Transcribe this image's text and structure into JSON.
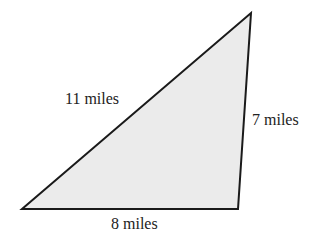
{
  "diagram": {
    "type": "triangle",
    "fill": "#ebebeb",
    "stroke": "#1a1a1a",
    "vertices": [
      [
        22,
        209
      ],
      [
        251,
        13
      ],
      [
        238,
        209
      ]
    ],
    "sides": [
      {
        "name": "hypotenuse",
        "label": "11 miles"
      },
      {
        "name": "right-side",
        "label": "7 miles"
      },
      {
        "name": "base",
        "label": "8 miles"
      }
    ]
  }
}
